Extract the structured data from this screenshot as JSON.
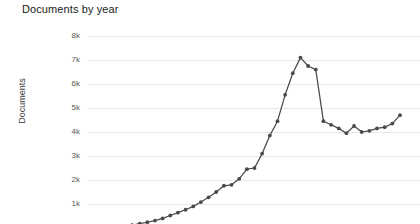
{
  "chart_data": {
    "type": "line",
    "title": "Documents by year",
    "xlabel": "",
    "ylabel": "Documents",
    "grid": true,
    "legend": null,
    "ylim": [
      0,
      8000
    ],
    "y_ticks": [
      {
        "label": "8k",
        "value": 8000
      },
      {
        "label": "7k",
        "value": 7000
      },
      {
        "label": "6k",
        "value": 6000
      },
      {
        "label": "5k",
        "value": 5000
      },
      {
        "label": "4k",
        "value": 4000
      },
      {
        "label": "3k",
        "value": 3000
      },
      {
        "label": "2k",
        "value": 2000
      },
      {
        "label": "1k",
        "value": 1000
      }
    ],
    "note_cropped": "x-axis and its tick labels are cut off below the visible frame",
    "series": [
      {
        "name": "Documents",
        "values": [
          120,
          180,
          240,
          310,
          400,
          520,
          640,
          760,
          900,
          1080,
          1280,
          1500,
          1760,
          1800,
          2050,
          2450,
          2500,
          3100,
          3850,
          4450,
          5550,
          6450,
          7100,
          6750,
          6600,
          4450,
          4300,
          4150,
          3950,
          4250,
          4000,
          4050,
          4150,
          4200,
          4350,
          4700
        ]
      }
    ]
  },
  "axis": {
    "y_title": "Documents"
  }
}
